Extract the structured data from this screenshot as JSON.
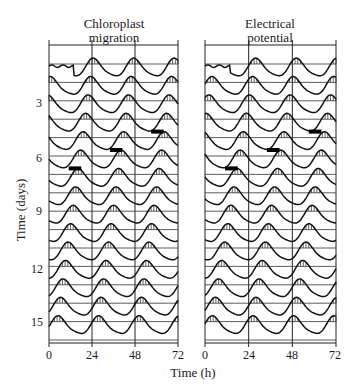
{
  "chart_data": {
    "type": "line",
    "title": "",
    "layout": "double-plotted actogram, two panels side by side",
    "panels": [
      {
        "id": "left",
        "title_line1": "Chloroplast",
        "title_line2": "migration",
        "xlabel": "Time (h)",
        "x_ticks": [
          0,
          24,
          48,
          72
        ],
        "xlim": [
          0,
          72
        ],
        "period_h": 22.6,
        "first_peak_h": 2.5,
        "markers": [
          {
            "day": 7,
            "x_h": 11,
            "width_h": 7
          },
          {
            "day": 6,
            "x_h": 34,
            "width_h": 7
          },
          {
            "day": 5,
            "x_h": 57,
            "width_h": 7
          }
        ]
      },
      {
        "id": "right",
        "title_line1": "Electrical",
        "title_line2": "potential",
        "xlabel": "Time (h)",
        "x_ticks": [
          0,
          24,
          48,
          72
        ],
        "xlim": [
          0,
          72
        ],
        "period_h": 22.3,
        "first_peak_h": 6,
        "markers": [
          {
            "day": 7,
            "x_h": 11,
            "width_h": 7
          },
          {
            "day": 6,
            "x_h": 34,
            "width_h": 7
          },
          {
            "day": 5,
            "x_h": 57,
            "width_h": 7
          }
        ]
      }
    ],
    "ylabel": "Time (days)",
    "y_ticks": [
      3,
      6,
      9,
      12,
      15
    ],
    "ylim": [
      1,
      16
    ],
    "days": 16,
    "grid": true,
    "fill_style": "vertical hatching above baseline"
  },
  "axes": {
    "x_ticks_left": [
      "0",
      "24",
      "48",
      "72"
    ],
    "x_ticks_right": [
      "0",
      "24",
      "48",
      "72"
    ],
    "y_ticks": [
      "3",
      "6",
      "9",
      "12",
      "15"
    ],
    "xlabel": "Time (h)",
    "ylabel": "Time (days)"
  },
  "titles": {
    "left_1": "Chloroplast",
    "left_2": "migration",
    "right_1": "Electrical",
    "right_2": "potential"
  }
}
